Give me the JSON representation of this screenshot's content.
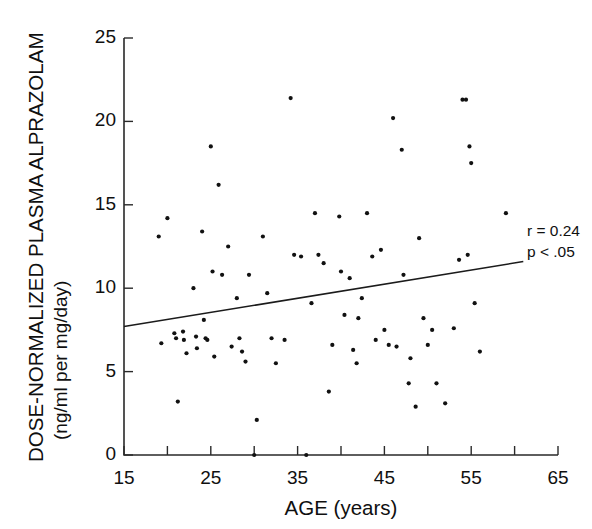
{
  "chart_data": {
    "type": "scatter",
    "title": "",
    "xlabel": "AGE (years)",
    "ylabel": "DOSE-NORMALIZED PLASMA ALPRAZOLAM (ng/ml per mg/day)",
    "ylabel_main": "DOSE-NORMALIZED PLASMA ALPRAZOLAM",
    "ylabel_units": "(ng/ml per mg/day)",
    "xlim": [
      15,
      65
    ],
    "ylim": [
      0,
      25
    ],
    "xticks": [
      15,
      25,
      35,
      45,
      55,
      65
    ],
    "xticks_minor": [
      20,
      30,
      40,
      50,
      60
    ],
    "yticks": [
      0,
      5,
      10,
      15,
      20,
      25
    ],
    "xtick_labels": [
      "15",
      "25",
      "35",
      "45",
      "55",
      "65"
    ],
    "ytick_labels": [
      "0",
      "5",
      "10",
      "15",
      "20",
      "25"
    ],
    "grid": false,
    "legend": "none",
    "annotations": [
      {
        "name": "correlation",
        "text": "r = 0.24"
      },
      {
        "name": "pvalue",
        "text": "p < .05"
      }
    ],
    "regression_line": {
      "x_start": 15.0,
      "y_start": 7.7,
      "x_end": 61.0,
      "y_end": 11.6,
      "slope": 0.085,
      "intercept": 6.43
    },
    "points": [
      {
        "x": 19.0,
        "y": 13.1
      },
      {
        "x": 19.3,
        "y": 6.7
      },
      {
        "x": 20.0,
        "y": 14.2
      },
      {
        "x": 20.8,
        "y": 7.3
      },
      {
        "x": 21.0,
        "y": 7.0
      },
      {
        "x": 21.2,
        "y": 3.2
      },
      {
        "x": 21.8,
        "y": 7.4
      },
      {
        "x": 21.9,
        "y": 6.9
      },
      {
        "x": 22.2,
        "y": 6.1
      },
      {
        "x": 23.0,
        "y": 10.0
      },
      {
        "x": 23.3,
        "y": 7.1
      },
      {
        "x": 23.4,
        "y": 6.4
      },
      {
        "x": 24.0,
        "y": 13.4
      },
      {
        "x": 24.2,
        "y": 8.1
      },
      {
        "x": 24.4,
        "y": 7.0
      },
      {
        "x": 24.6,
        "y": 6.9
      },
      {
        "x": 25.0,
        "y": 18.5
      },
      {
        "x": 25.2,
        "y": 11.0
      },
      {
        "x": 25.4,
        "y": 5.9
      },
      {
        "x": 25.9,
        "y": 16.2
      },
      {
        "x": 26.3,
        "y": 10.8
      },
      {
        "x": 27.0,
        "y": 12.5
      },
      {
        "x": 27.4,
        "y": 6.5
      },
      {
        "x": 28.0,
        "y": 9.4
      },
      {
        "x": 28.3,
        "y": 7.0
      },
      {
        "x": 28.6,
        "y": 6.2
      },
      {
        "x": 29.0,
        "y": 5.6
      },
      {
        "x": 29.4,
        "y": 10.8
      },
      {
        "x": 30.0,
        "y": 0.0
      },
      {
        "x": 30.3,
        "y": 2.1
      },
      {
        "x": 31.0,
        "y": 13.1
      },
      {
        "x": 31.5,
        "y": 9.7
      },
      {
        "x": 32.0,
        "y": 7.0
      },
      {
        "x": 32.5,
        "y": 5.5
      },
      {
        "x": 33.5,
        "y": 6.9
      },
      {
        "x": 34.2,
        "y": 21.4
      },
      {
        "x": 34.6,
        "y": 12.0
      },
      {
        "x": 35.4,
        "y": 11.9
      },
      {
        "x": 36.0,
        "y": 0.0
      },
      {
        "x": 36.6,
        "y": 9.1
      },
      {
        "x": 37.0,
        "y": 14.5
      },
      {
        "x": 37.4,
        "y": 12.0
      },
      {
        "x": 38.0,
        "y": 11.5
      },
      {
        "x": 38.6,
        "y": 3.8
      },
      {
        "x": 39.0,
        "y": 6.6
      },
      {
        "x": 39.8,
        "y": 14.3
      },
      {
        "x": 40.0,
        "y": 11.0
      },
      {
        "x": 40.4,
        "y": 8.4
      },
      {
        "x": 41.0,
        "y": 10.6
      },
      {
        "x": 41.4,
        "y": 6.3
      },
      {
        "x": 41.8,
        "y": 5.5
      },
      {
        "x": 42.0,
        "y": 8.2
      },
      {
        "x": 42.4,
        "y": 9.4
      },
      {
        "x": 43.0,
        "y": 14.5
      },
      {
        "x": 43.6,
        "y": 11.9
      },
      {
        "x": 44.0,
        "y": 6.9
      },
      {
        "x": 44.6,
        "y": 12.3
      },
      {
        "x": 45.0,
        "y": 7.5
      },
      {
        "x": 45.5,
        "y": 6.6
      },
      {
        "x": 46.0,
        "y": 20.2
      },
      {
        "x": 46.4,
        "y": 6.5
      },
      {
        "x": 47.0,
        "y": 18.3
      },
      {
        "x": 47.2,
        "y": 10.8
      },
      {
        "x": 47.8,
        "y": 4.3
      },
      {
        "x": 48.0,
        "y": 5.8
      },
      {
        "x": 48.6,
        "y": 2.9
      },
      {
        "x": 49.0,
        "y": 13.0
      },
      {
        "x": 49.5,
        "y": 8.2
      },
      {
        "x": 50.0,
        "y": 6.6
      },
      {
        "x": 50.5,
        "y": 7.5
      },
      {
        "x": 51.0,
        "y": 4.3
      },
      {
        "x": 52.0,
        "y": 3.1
      },
      {
        "x": 53.0,
        "y": 7.6
      },
      {
        "x": 53.6,
        "y": 11.7
      },
      {
        "x": 54.0,
        "y": 21.3
      },
      {
        "x": 54.4,
        "y": 21.3
      },
      {
        "x": 54.6,
        "y": 12.0
      },
      {
        "x": 54.8,
        "y": 18.5
      },
      {
        "x": 55.0,
        "y": 17.5
      },
      {
        "x": 55.4,
        "y": 9.1
      },
      {
        "x": 56.0,
        "y": 6.2
      },
      {
        "x": 59.0,
        "y": 14.5
      }
    ]
  }
}
